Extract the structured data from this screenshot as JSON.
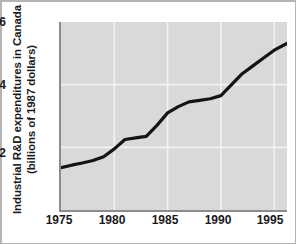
{
  "chart_data": {
    "type": "line",
    "title": "",
    "xlabel": "",
    "ylabel": "Industrial R&D expenditures in Canada (billions of 1987 dollars)",
    "ylabel_line1": "Industrial R&D expenditures in Canada",
    "ylabel_line2": "(billions of 1987 dollars)",
    "xlim": [
      1975,
      1996.2
    ],
    "ylim": [
      0,
      6
    ],
    "xticks": [
      1975,
      1980,
      1985,
      1990,
      1995
    ],
    "xtick_labels": [
      "1975",
      "1980",
      "1985",
      "1990",
      "1995"
    ],
    "yticks": [
      2,
      4,
      6
    ],
    "ytick_labels": [
      "2",
      "4",
      "6"
    ],
    "grid": true,
    "grid_color": "#f2f2f2",
    "legend": null,
    "plot_bgcolor": "#d9d9d9",
    "line_color": "#141414",
    "line_width": 3.2,
    "x": [
      1975,
      1976,
      1977,
      1978,
      1979,
      1980,
      1981,
      1982,
      1983,
      1984,
      1985,
      1986,
      1987,
      1988,
      1989,
      1990,
      1991,
      1992,
      1993,
      1994,
      1995,
      1996.2
    ],
    "values": [
      1.35,
      1.43,
      1.5,
      1.58,
      1.7,
      1.95,
      2.25,
      2.3,
      2.35,
      2.7,
      3.1,
      3.3,
      3.45,
      3.5,
      3.55,
      3.65,
      4.0,
      4.35,
      4.6,
      4.85,
      5.1,
      5.32
    ],
    "series": [
      {
        "name": "Industrial R&D expenditures",
        "values": [
          1.35,
          1.43,
          1.5,
          1.58,
          1.7,
          1.95,
          2.25,
          2.3,
          2.35,
          2.7,
          3.1,
          3.3,
          3.45,
          3.5,
          3.55,
          3.65,
          4.0,
          4.35,
          4.6,
          4.85,
          5.1,
          5.32
        ]
      }
    ]
  }
}
